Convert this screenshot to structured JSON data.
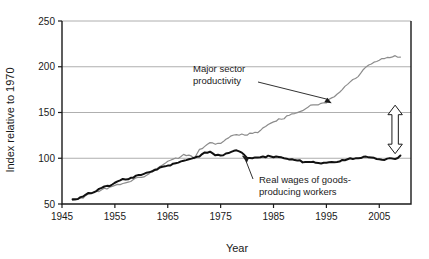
{
  "chart_data": {
    "type": "line",
    "title": "",
    "xlabel": "Year",
    "ylabel": "Index relative to 1970",
    "xlim": [
      1945,
      2011
    ],
    "ylim": [
      50,
      250
    ],
    "xticks": [
      1945,
      1955,
      1965,
      1975,
      1985,
      1995,
      2005
    ],
    "yticks": [
      50,
      100,
      150,
      200,
      250
    ],
    "grid": "horizontal",
    "legend": "annotations",
    "annotations": [
      {
        "name": "productivity-label",
        "text_line1": "Major sector",
        "text_line2": "productivity",
        "points_to_x": 1996,
        "points_to_y": 160
      },
      {
        "name": "wages-label",
        "text_line1": "Real wages of goods-",
        "text_line2": "producing workers",
        "points_to_x": 1979,
        "points_to_y": 103
      },
      {
        "name": "gap-arrow",
        "text": "",
        "at_x": 2008,
        "from_y": 105,
        "to_y": 158
      }
    ],
    "series": [
      {
        "name": "Major sector productivity",
        "color": "#8c8c8c",
        "x": [
          1947,
          1948,
          1949,
          1950,
          1951,
          1952,
          1953,
          1954,
          1955,
          1956,
          1957,
          1958,
          1959,
          1960,
          1961,
          1962,
          1963,
          1964,
          1965,
          1966,
          1967,
          1968,
          1969,
          1970,
          1971,
          1972,
          1973,
          1974,
          1975,
          1976,
          1977,
          1978,
          1979,
          1980,
          1981,
          1982,
          1983,
          1984,
          1985,
          1986,
          1987,
          1988,
          1989,
          1990,
          1991,
          1992,
          1993,
          1994,
          1995,
          1996,
          1997,
          1998,
          1999,
          2000,
          2001,
          2002,
          2003,
          2004,
          2005,
          2006,
          2007,
          2008,
          2009
        ],
        "values": [
          54,
          55,
          57,
          61,
          63,
          64,
          67,
          68,
          71,
          71,
          73,
          75,
          78,
          79,
          82,
          86,
          89,
          93,
          96,
          99,
          100,
          104,
          104,
          100,
          109,
          113,
          117,
          115,
          117,
          121,
          124,
          126,
          126,
          125,
          128,
          128,
          133,
          137,
          139,
          143,
          144,
          147,
          149,
          151,
          153,
          158,
          159,
          160,
          161,
          166,
          169,
          175,
          181,
          186,
          190,
          197,
          201,
          205,
          207,
          209,
          211,
          212,
          210
        ],
        "linewidth": 1.2
      },
      {
        "name": "Real wages of goods-producing workers",
        "color": "#111111",
        "x": [
          1947,
          1948,
          1949,
          1950,
          1951,
          1952,
          1953,
          1954,
          1955,
          1956,
          1957,
          1958,
          1959,
          1960,
          1961,
          1962,
          1963,
          1964,
          1965,
          1966,
          1967,
          1968,
          1969,
          1970,
          1971,
          1972,
          1973,
          1974,
          1975,
          1976,
          1977,
          1978,
          1979,
          1980,
          1981,
          1982,
          1983,
          1984,
          1985,
          1986,
          1987,
          1988,
          1989,
          1990,
          1991,
          1992,
          1993,
          1994,
          1995,
          1996,
          1997,
          1998,
          1999,
          2000,
          2001,
          2002,
          2003,
          2004,
          2005,
          2006,
          2007,
          2008,
          2009
        ],
        "values": [
          55,
          56,
          58,
          62,
          63,
          66,
          69,
          70,
          73,
          76,
          77,
          78,
          81,
          82,
          84,
          86,
          88,
          90,
          92,
          94,
          95,
          98,
          99,
          100,
          102,
          106,
          107,
          104,
          103,
          105,
          107,
          108,
          106,
          101,
          100,
          101,
          102,
          102,
          101,
          102,
          100,
          99,
          98,
          97,
          96,
          96,
          95,
          95,
          95,
          95,
          96,
          98,
          99,
          100,
          100,
          101,
          101,
          100,
          99,
          99,
          100,
          99,
          103
        ],
        "linewidth": 2.0
      }
    ]
  },
  "axis": {
    "y_title": "Index relative to 1970",
    "x_title": "Year"
  }
}
